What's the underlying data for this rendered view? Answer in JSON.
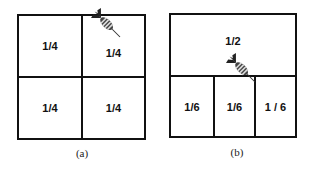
{
  "figure": {
    "panels": [
      {
        "id": "a",
        "caption": "(a)",
        "cells": [
          {
            "label": "1/4",
            "region": "top-left"
          },
          {
            "label": "1/4",
            "region": "top-right"
          },
          {
            "label": "1/4",
            "region": "bottom-left"
          },
          {
            "label": "1/4",
            "region": "bottom-right"
          }
        ],
        "dart_location": "top-right cell, upper border"
      },
      {
        "id": "b",
        "caption": "(b)",
        "cells": [
          {
            "label": "1/2",
            "region": "top"
          },
          {
            "label": "1/6",
            "region": "bottom-left"
          },
          {
            "label": "1/6",
            "region": "bottom-middle"
          },
          {
            "label": "1 / 6",
            "region": "bottom-right"
          }
        ],
        "dart_location": "middle bottom cell, top border"
      }
    ],
    "icons": {
      "dart": "dart-icon"
    },
    "colors": {
      "line": "#111111",
      "background": "#ffffff"
    }
  }
}
